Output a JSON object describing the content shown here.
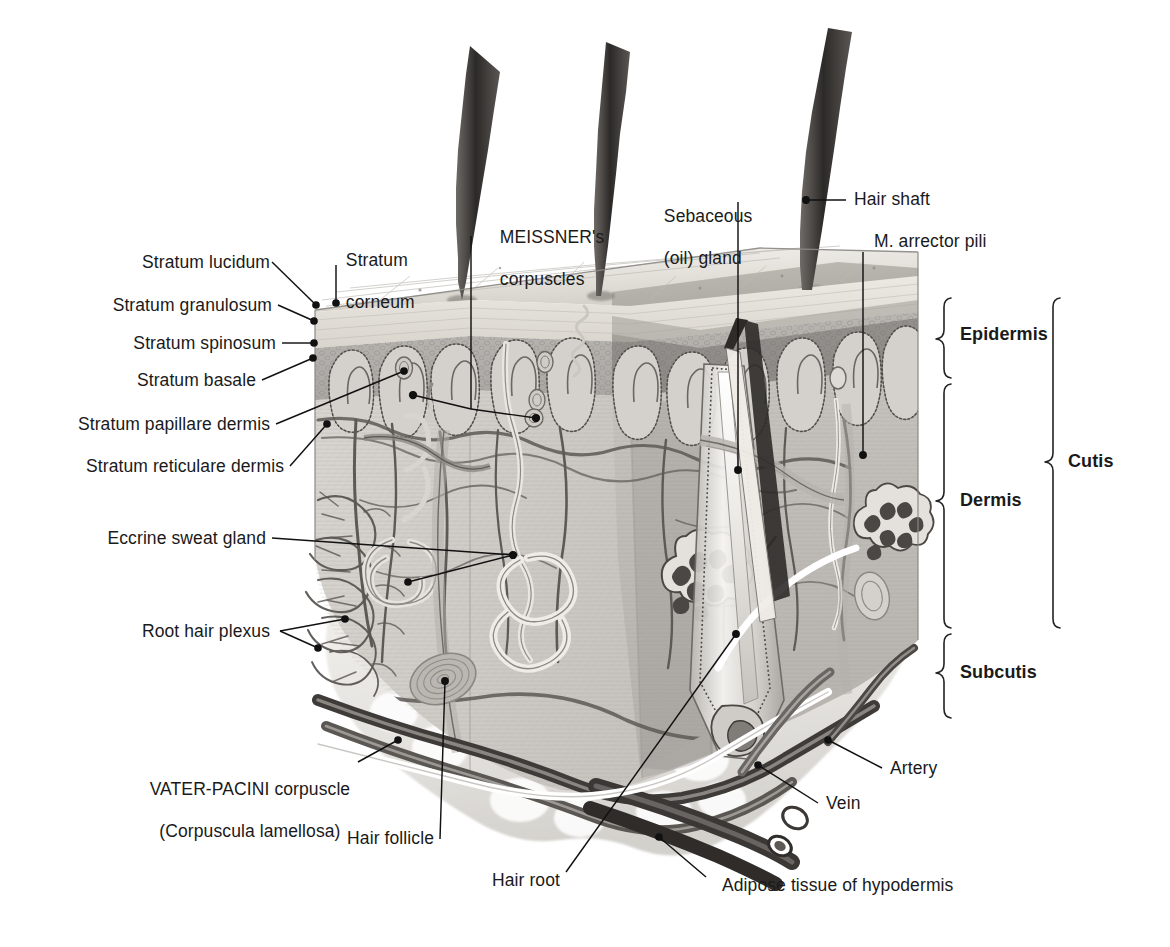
{
  "figure": {
    "kind": "anatomical-illustration",
    "background": "#ffffff",
    "ink": "#1a1a1a"
  },
  "labels": {
    "left": [
      {
        "id": "stratum-lucidum",
        "text": "Stratum lucidum"
      },
      {
        "id": "stratum-granulosum",
        "text": "Stratum granulosum"
      },
      {
        "id": "stratum-spinosum",
        "text": "Stratum spinosum"
      },
      {
        "id": "stratum-basale",
        "text": "Stratum basale"
      },
      {
        "id": "stratum-papillare-dermis",
        "text": "Stratum papillare dermis"
      },
      {
        "id": "stratum-reticulare-dermis",
        "text": "Stratum reticulare dermis"
      },
      {
        "id": "eccrine-sweat-gland",
        "text": "Eccrine sweat gland"
      },
      {
        "id": "root-hair-plexus",
        "text": "Root hair plexus"
      }
    ],
    "top": [
      {
        "id": "stratum-corneum",
        "line1": "Stratum",
        "line2": "corneum"
      },
      {
        "id": "meissners-corpuscles",
        "line1": "MEISSNER's",
        "line2": "corpuscles"
      },
      {
        "id": "sebaceous-oil-gland",
        "line1": "Sebaceous",
        "line2": "(oil) gland"
      },
      {
        "id": "hair-shaft",
        "line1": "Hair shaft",
        "line2": ""
      },
      {
        "id": "m-arrector-pili",
        "line1": "M. arrector pili",
        "line2": ""
      }
    ],
    "bottom": [
      {
        "id": "vater-pacini-corpuscle",
        "line1": "VATER-PACINI corpuscle",
        "line2": "(Corpuscula lamellosa)"
      },
      {
        "id": "hair-follicle",
        "line1": "Hair follicle",
        "line2": ""
      },
      {
        "id": "hair-root",
        "line1": "Hair root",
        "line2": ""
      },
      {
        "id": "adipose-tissue",
        "line1": "Adipose tissue of hypodermis",
        "line2": ""
      },
      {
        "id": "vein",
        "line1": "Vein",
        "line2": ""
      },
      {
        "id": "artery",
        "line1": "Artery",
        "line2": ""
      }
    ],
    "brackets": [
      {
        "id": "epidermis",
        "text": "Epidermis"
      },
      {
        "id": "dermis",
        "text": "Dermis"
      },
      {
        "id": "subcutis",
        "text": "Subcutis"
      },
      {
        "id": "cutis",
        "text": "Cutis"
      }
    ]
  }
}
